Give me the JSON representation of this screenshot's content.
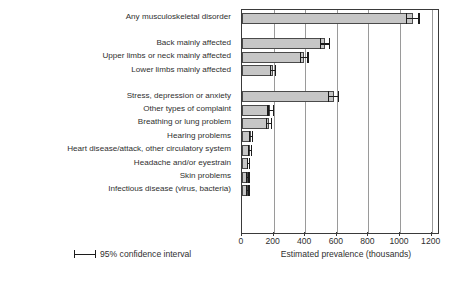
{
  "chart_data": {
    "type": "bar",
    "orientation": "horizontal",
    "title": "",
    "xlabel": "Estimated prevalence (thousands)",
    "ylabel": "",
    "xlim": [
      0,
      1240
    ],
    "xticks": [
      0,
      200,
      400,
      600,
      800,
      1000,
      1200
    ],
    "grid": "vertical",
    "legend": {
      "position": "bottom-left",
      "entries": [
        {
          "label": "95% confidence interval",
          "marker": "error-bar"
        }
      ]
    },
    "categories": [
      "Any musculoskeletal disorder",
      "Back mainly affected",
      "Upper limbs or neck mainly affected",
      "Lower limbs mainly affected",
      "Stress, depression or anxiety",
      "Other types of complaint",
      "Breathing or lung problem",
      "Hearing problems",
      "Heart disease/attack, other circulatory system",
      "Headache and/or eyestrain",
      "Skin problems",
      "Infectious disease (virus, bacteria)"
    ],
    "values": [
      1080,
      525,
      395,
      195,
      580,
      180,
      170,
      55,
      50,
      40,
      35,
      35
    ],
    "ci_low": [
      1040,
      495,
      372,
      180,
      548,
      164,
      155,
      46,
      42,
      33,
      28,
      28
    ],
    "ci_high": [
      1120,
      555,
      418,
      212,
      612,
      198,
      186,
      66,
      60,
      49,
      44,
      44
    ],
    "group_breaks_after": [
      0,
      3
    ],
    "bar_fill": "#c6c6c6",
    "bar_edge": "#4a4a4a",
    "error_color": "#1c1c1c",
    "grid_color": "#9a9a9a"
  },
  "xticklabels": [
    "0",
    "200",
    "400",
    "600",
    "800",
    "1000",
    "1200"
  ],
  "axis": {
    "xlabel": "Estimated prevalence (thousands)"
  },
  "legend": {
    "ci_label": "95% confidence interval"
  }
}
